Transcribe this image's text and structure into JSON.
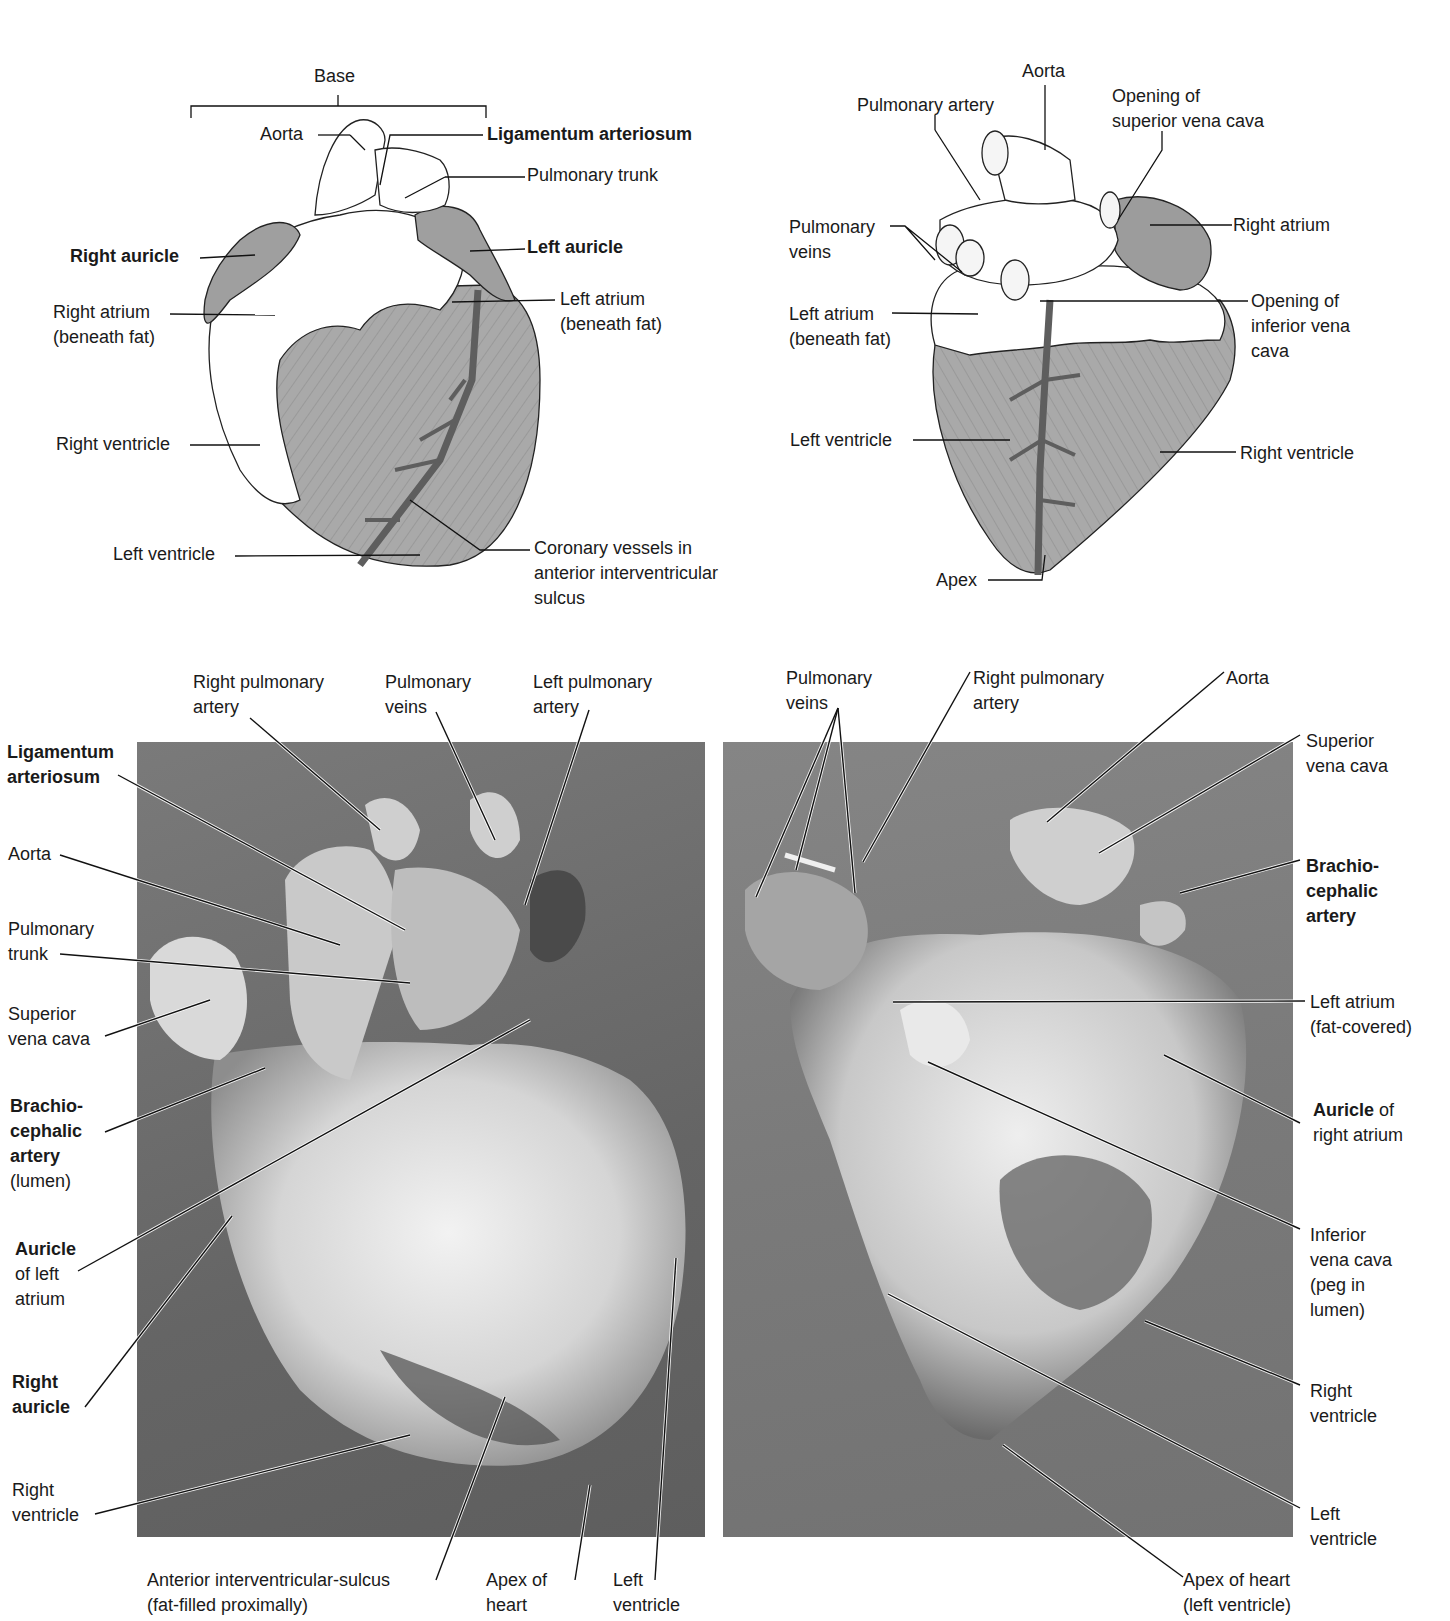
{
  "figure": {
    "cropped_header_fragment": "",
    "panels": [
      {
        "id": "diagram-anterior",
        "type": "line-illustration",
        "labels": {
          "base": "Base",
          "aorta": "Aorta",
          "ligamentum_arteriosum": "Ligamentum arteriosum",
          "pulmonary_trunk": "Pulmonary trunk",
          "right_auricle": "Right auricle",
          "left_auricle": "Left auricle",
          "right_atrium": "Right atrium\n(beneath fat)",
          "left_atrium": "Left atrium\n(beneath fat)",
          "right_ventricle": "Right ventricle",
          "left_ventricle": "Left ventricle",
          "coronary_vessels": "Coronary vessels in\nanterior interventricular\nsulcus"
        },
        "bold_labels": [
          "ligamentum_arteriosum",
          "right_auricle",
          "left_auricle"
        ]
      },
      {
        "id": "diagram-posterior",
        "type": "line-illustration",
        "labels": {
          "aorta": "Aorta",
          "pulmonary_artery": "Pulmonary artery",
          "opening_svc": "Opening of\nsuperior vena cava",
          "pulmonary_veins": "Pulmonary\nveins",
          "right_atrium": "Right atrium",
          "left_atrium": "Left atrium\n(beneath fat)",
          "opening_ivc": "Opening of\ninferior vena\ncava",
          "left_ventricle": "Left ventricle",
          "right_ventricle": "Right ventricle",
          "apex": "Apex"
        }
      },
      {
        "id": "photo-anterior",
        "type": "photograph",
        "labels": {
          "right_pulmonary_artery": "Right pulmonary\nartery",
          "pulmonary_veins": "Pulmonary\nveins",
          "left_pulmonary_artery": "Left pulmonary\nartery",
          "ligamentum_arteriosum": "Ligamentum\narteriosum",
          "aorta": "Aorta",
          "pulmonary_trunk": "Pulmonary\ntrunk",
          "superior_vena_cava": "Superior\nvena cava",
          "brachiocephalic_bold": "Brachio-\ncephalic\nartery",
          "brachiocephalic_rest": "(lumen)",
          "auricle_left_bold": "Auricle",
          "auricle_left_rest": "of left\natrium",
          "right_auricle": "Right\nauricle",
          "right_ventricle": "Right\nventricle",
          "anterior_sulcus": "Anterior interventricular-sulcus\n(fat-filled proximally)",
          "apex_of_heart": "Apex of\nheart",
          "left_ventricle": "Left\nventricle"
        }
      },
      {
        "id": "photo-posterior",
        "type": "photograph",
        "labels": {
          "pulmonary_veins": "Pulmonary\nveins",
          "right_pulmonary_artery": "Right pulmonary\nartery",
          "aorta": "Aorta",
          "superior_vena_cava": "Superior\nvena cava",
          "brachiocephalic": "Brachio-\ncephalic\nartery",
          "left_atrium": "Left atrium\n(fat-covered)",
          "auricle_right_bold": "Auricle",
          "auricle_right_rest": " of",
          "auricle_right_line2": "right atrium",
          "inferior_vena_cava": "Inferior\nvena cava\n(peg in\nlumen)",
          "right_ventricle": "Right\nventricle",
          "left_ventricle": "Left\nventricle",
          "apex_of_heart": "Apex of heart\n(left ventricle)"
        }
      }
    ],
    "colors": {
      "muscle_gray": "#a9a9a9",
      "fat_white": "#ffffff",
      "vessel_dark": "#6b6b6b",
      "photo_bg": "#707070",
      "ink": "#1a1a1a"
    }
  }
}
